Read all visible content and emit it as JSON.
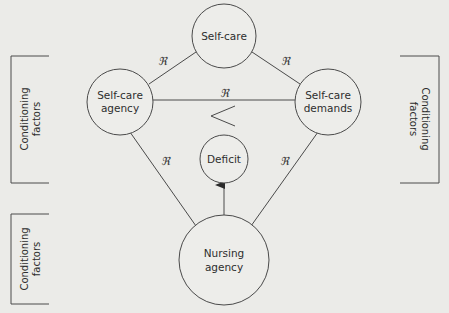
{
  "diagram": {
    "nodes": {
      "self_care": {
        "label_line1": "Self-care",
        "label_line2": ""
      },
      "self_care_agency": {
        "label_line1": "Self-care",
        "label_line2": "agency"
      },
      "self_care_demands": {
        "label_line1": "Self-care",
        "label_line2": "demands"
      },
      "deficit": {
        "label_line1": "Deficit",
        "label_line2": ""
      },
      "nursing_agency": {
        "label_line1": "Nursing",
        "label_line2": "agency"
      }
    },
    "relations": {
      "symbol": "ℜ",
      "agency_to_selfcare": "ℜ",
      "selfcare_to_demands": "ℜ",
      "agency_to_demands": "ℜ",
      "agency_to_nursing": "ℜ",
      "demands_to_nursing": "ℜ"
    },
    "comparison_symbol": "<",
    "conditioning": {
      "left_top": {
        "line1": "Conditioning",
        "line2": "factors"
      },
      "right": {
        "line1": "Conditioning",
        "line2": "factors"
      },
      "left_bottom": {
        "line1": "Conditioning",
        "line2": "factors"
      }
    },
    "colors": {
      "background": "#ebebe8",
      "stroke": "#4a4a4a",
      "text": "#2e2e2e"
    }
  }
}
